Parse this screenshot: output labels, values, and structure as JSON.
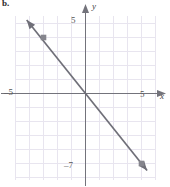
{
  "panel": {
    "label": "b."
  },
  "axis_labels": {
    "x": "x",
    "y": "y",
    "x_left_tick": "–5",
    "x_right_tick": "5",
    "y_top_tick": "5",
    "y_bottom_tick": "–7"
  },
  "colors": {
    "grid": "#e7e4ee",
    "axis": "#6e6e76",
    "line": "#6f6f78",
    "point": "#85858d",
    "text": "#3a3a3a"
  },
  "chart_data": {
    "type": "line",
    "title": "",
    "xlabel": "x",
    "ylabel": "y",
    "xlim": [
      -5,
      5
    ],
    "ylim": [
      -7,
      5
    ],
    "grid": true,
    "grid_step": 1,
    "legend": null,
    "series": [
      {
        "name": "line",
        "kind": "line",
        "equation": "y = -1.25x",
        "slope": -1.25,
        "intercept": 0,
        "x": [
          -4.2,
          4.4
        ],
        "y": [
          5.25,
          -5.5
        ],
        "arrow_start": true,
        "arrow_end": true
      },
      {
        "name": "plotted-points",
        "kind": "scatter",
        "x": [
          -3,
          4
        ],
        "y": [
          4,
          -5
        ],
        "marker": "square"
      }
    ]
  }
}
